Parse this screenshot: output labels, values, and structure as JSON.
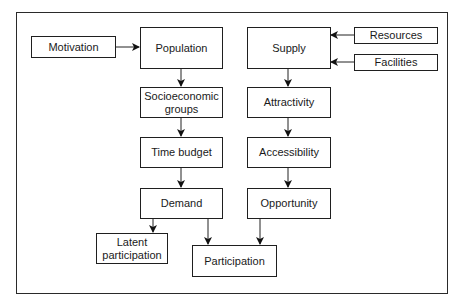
{
  "diagram": {
    "type": "flowchart",
    "nodes": {
      "motivation": {
        "label": "Motivation"
      },
      "population": {
        "label": "Population"
      },
      "supply": {
        "label": "Supply"
      },
      "resources": {
        "label": "Resources"
      },
      "facilities": {
        "label": "Facilities"
      },
      "socioeconomic": {
        "line1": "Socioeconomic",
        "line2": "groups"
      },
      "attractivity": {
        "label": "Attractivity"
      },
      "time_budget": {
        "label": "Time budget"
      },
      "accessibility": {
        "label": "Accessibility"
      },
      "demand": {
        "label": "Demand"
      },
      "opportunity": {
        "label": "Opportunity"
      },
      "latent_participation": {
        "line1": "Latent",
        "line2": "participation"
      },
      "participation": {
        "label": "Participation"
      }
    },
    "edges": [
      {
        "from": "Motivation",
        "to": "Population"
      },
      {
        "from": "Resources",
        "to": "Supply"
      },
      {
        "from": "Facilities",
        "to": "Supply"
      },
      {
        "from": "Population",
        "to": "Socioeconomic groups"
      },
      {
        "from": "Socioeconomic groups",
        "to": "Time budget"
      },
      {
        "from": "Time budget",
        "to": "Demand"
      },
      {
        "from": "Demand",
        "to": "Latent participation"
      },
      {
        "from": "Demand",
        "to": "Participation"
      },
      {
        "from": "Supply",
        "to": "Attractivity"
      },
      {
        "from": "Attractivity",
        "to": "Accessibility"
      },
      {
        "from": "Accessibility",
        "to": "Opportunity"
      },
      {
        "from": "Opportunity",
        "to": "Participation"
      }
    ],
    "colors": {
      "stroke": "#1f1f1f",
      "background": "#ffffff"
    }
  }
}
